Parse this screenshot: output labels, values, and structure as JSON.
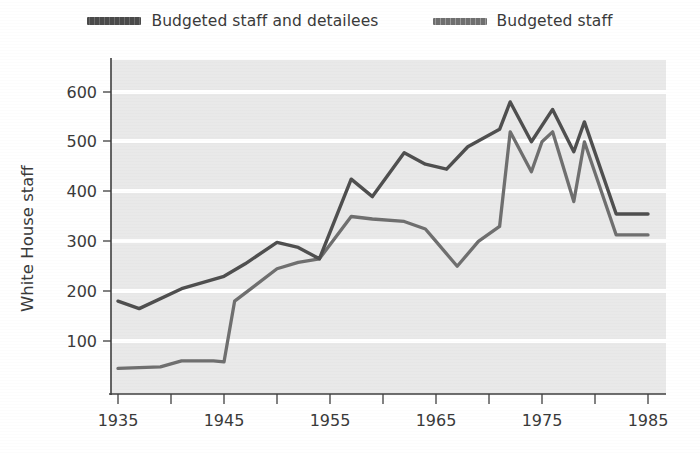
{
  "legend": {
    "position": "top-center",
    "items": [
      {
        "label": "Budgeted staff and detailees",
        "swatch": "line-swatch-dark",
        "color": "#4f4f4f"
      },
      {
        "label": "Budgeted staff",
        "swatch": "line-swatch-gray",
        "color": "#6f6f6f"
      }
    ]
  },
  "axes": {
    "ylabel": "White House staff",
    "xlabel": "",
    "y_ticks": [
      "100",
      "200",
      "300",
      "400",
      "500",
      "600"
    ],
    "x_ticks": [
      "1935",
      "1945",
      "1955",
      "1965",
      "1975",
      "1985"
    ],
    "x_minor_ticks": [
      "1940",
      "1950",
      "1960",
      "1970",
      "1980"
    ]
  },
  "style": {
    "plot_background": "#e9e9e9",
    "gridline_color": "#ffffff",
    "axis_color": "#3f3f3f",
    "page_background": "#ffffff"
  },
  "chart_data": {
    "type": "line",
    "title": "",
    "xlabel": "",
    "ylabel": "White House staff",
    "xlim": [
      1935,
      1985
    ],
    "ylim": [
      0,
      650
    ],
    "y_ticks": [
      100,
      200,
      300,
      400,
      500,
      600
    ],
    "x_ticks": [
      1935,
      1940,
      1945,
      1950,
      1955,
      1960,
      1965,
      1970,
      1975,
      1980,
      1985
    ],
    "x_tick_labels": [
      1935,
      1945,
      1955,
      1965,
      1975,
      1985
    ],
    "grid": "horizontal-white-lines",
    "legend_position": "above-plot-center",
    "series": [
      {
        "name": "Budgeted staff and detailees",
        "color": "#4f4f4f",
        "x": [
          1935,
          1937,
          1941,
          1945,
          1947,
          1950,
          1952,
          1954,
          1957,
          1959,
          1962,
          1964,
          1966,
          1968,
          1971,
          1972,
          1974,
          1976,
          1978,
          1979,
          1982,
          1985
        ],
        "values": [
          180,
          165,
          205,
          230,
          255,
          298,
          288,
          265,
          425,
          390,
          478,
          455,
          445,
          490,
          525,
          580,
          500,
          565,
          480,
          540,
          355,
          355
        ]
      },
      {
        "name": "Budgeted staff",
        "color": "#6f6f6f",
        "x": [
          1935,
          1939,
          1941,
          1944,
          1945,
          1946,
          1950,
          1952,
          1954,
          1957,
          1959,
          1962,
          1964,
          1965,
          1967,
          1969,
          1971,
          1972,
          1974,
          1975,
          1976,
          1978,
          1979,
          1982,
          1985
        ],
        "values": [
          45,
          48,
          60,
          60,
          58,
          180,
          245,
          258,
          265,
          350,
          345,
          340,
          325,
          300,
          250,
          300,
          330,
          520,
          440,
          500,
          520,
          380,
          500,
          313,
          313
        ]
      }
    ]
  },
  "geometry": {
    "plot_left": 111,
    "plot_right": 666,
    "plot_top": 60,
    "plot_bottom": 394,
    "x_year_min": 1935,
    "x_year_max": 1985,
    "x_px_1935": 118,
    "x_px_1985": 648,
    "y_px_100": 341,
    "y_px_600": 92
  }
}
